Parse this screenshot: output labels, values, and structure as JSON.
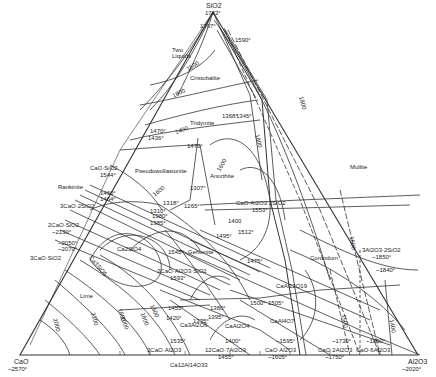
{
  "diagram": {
    "type": "ternary-phase-diagram",
    "vertices": {
      "top": {
        "label": "SiO2",
        "temp": "1723°"
      },
      "left": {
        "label": "CaO",
        "temp": "~2570°"
      },
      "right": {
        "label": "Al2O3",
        "temp": "~2020°"
      }
    },
    "phase_fields": [
      "Two Liquids",
      "Cristobalite",
      "Tridymite",
      "Pseudowollastonite",
      "Rankinite",
      "Anorthite",
      "Mullite",
      "Gehlenite",
      "Corundum",
      "Lime",
      "Ca2SiO4",
      "Ca3SiO5",
      "CaAl12O19",
      "CaAl4O7",
      "CaAl2O4",
      "Ca12Al14O33",
      "Ca3Al2O6"
    ],
    "compounds": {
      "cs": {
        "name": "CaO·SiO2",
        "temp": "1544°"
      },
      "c3s2": {
        "name": "3CaO·2SiO2",
        "temp": "1460° 1464°"
      },
      "c2s": {
        "name": "2CaO·SiO2",
        "temp": "~2130°"
      },
      "c3s": {
        "name": "3CaO·SiO2",
        "temp": "~2050° ~2070°"
      },
      "cas2": {
        "name": "CaO·Al2O3·2SiO2",
        "temp": "1553°"
      },
      "c2as": {
        "name": "2CaO·Al2O3·SiO2",
        "temp": "1593°"
      },
      "a3s2": {
        "name": "3Al2O3·2SiO2",
        "temp": "~1850°"
      },
      "c3a": {
        "name": "3CaO·Al2O3"
      },
      "c12a7": {
        "name": "12CaO·7Al2O3",
        "temp": "1455°"
      },
      "c12a14": {
        "name": "Ca12Al14O33"
      },
      "ca": {
        "name": "CaO·Al2O3",
        "temp": "~1605°"
      },
      "ca2": {
        "name": "CaO·2Al2O3",
        "temp": "~1750°"
      },
      "ca6": {
        "name": "CaO·6Al2O3"
      }
    },
    "temperatures": {
      "t1707a": "1707°",
      "t1590": "1590°",
      "t1470": "1470°",
      "t1436": "1436°",
      "t1368": "1368°",
      "t1345": "1345°",
      "t1470b": "1470°",
      "t1307": "1307°",
      "t1318": "1318°",
      "t1310": "1310°",
      "t1265": "1265°",
      "t1380": "1380°",
      "t1385": "1385°",
      "t1512": "1512°",
      "t1495": "1495°",
      "t1475": "1475°",
      "t1840": "~1840°",
      "t1545": "1545°",
      "t1455a": "1455°",
      "t1420": "1420°",
      "t1335": "1335°",
      "t1380b": "1380°",
      "t1395": "1395°",
      "t1500": "1500°",
      "t1505": "1505°",
      "t1535": "1535°",
      "t1400": "1400°",
      "t1595": "~1595°",
      "t1730": "~1730°",
      "t1890": "~1890°"
    },
    "isotherms": [
      "1600",
      "1800",
      "1400",
      "1600",
      "1800",
      "1800",
      "1600",
      "1400",
      "1600",
      "2000",
      "2200",
      "1800",
      "2000",
      "1800",
      "1600",
      "1500",
      "1400"
    ]
  }
}
